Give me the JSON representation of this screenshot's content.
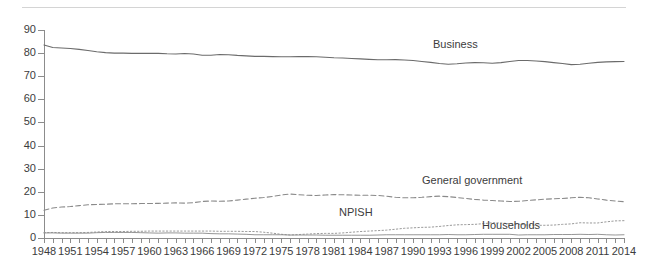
{
  "chart_data": {
    "type": "line",
    "title": "",
    "subtitle": "",
    "xlabel": "",
    "ylabel": "",
    "ylim": [
      0,
      90
    ],
    "xlim": [
      1948,
      2014
    ],
    "grid": false,
    "legend_position": "inline-labels",
    "ytick_labels": [
      "0",
      "10",
      "20",
      "30",
      "40",
      "50",
      "60",
      "70",
      "80",
      "90"
    ],
    "ytick_values": [
      0,
      10,
      20,
      30,
      40,
      50,
      60,
      70,
      80,
      90
    ],
    "xtick_labels": [
      "1948",
      "1951",
      "1954",
      "1957",
      "1960",
      "1963",
      "1966",
      "1969",
      "1972",
      "1975",
      "1978",
      "1981",
      "1984",
      "1987",
      "1990",
      "1993",
      "1996",
      "1999",
      "2002",
      "2005",
      "2008",
      "2011",
      "2014"
    ],
    "xtick_values": [
      1948,
      1951,
      1954,
      1957,
      1960,
      1963,
      1966,
      1969,
      1972,
      1975,
      1978,
      1981,
      1984,
      1987,
      1990,
      1993,
      1996,
      1999,
      2002,
      2005,
      2008,
      2011,
      2014
    ],
    "x": [
      1948,
      1949,
      1950,
      1951,
      1952,
      1953,
      1954,
      1955,
      1956,
      1957,
      1958,
      1959,
      1960,
      1961,
      1962,
      1963,
      1964,
      1965,
      1966,
      1967,
      1968,
      1969,
      1970,
      1971,
      1972,
      1973,
      1974,
      1975,
      1976,
      1977,
      1978,
      1979,
      1980,
      1981,
      1982,
      1983,
      1984,
      1985,
      1986,
      1987,
      1988,
      1989,
      1990,
      1991,
      1992,
      1993,
      1994,
      1995,
      1996,
      1997,
      1998,
      1999,
      2000,
      2001,
      2002,
      2003,
      2004,
      2005,
      2006,
      2007,
      2008,
      2009,
      2010,
      2011,
      2012,
      2013,
      2014
    ],
    "series": [
      {
        "name": "Business",
        "style": "solid",
        "color": "#6b6b6b",
        "annotation_label": "Business",
        "values": [
          83.5,
          82.4,
          82.2,
          82.0,
          81.6,
          81.1,
          80.6,
          80.2,
          80.0,
          80.0,
          79.9,
          79.9,
          79.9,
          79.9,
          79.7,
          79.6,
          79.8,
          79.6,
          79.1,
          79.1,
          79.4,
          79.3,
          79.0,
          78.8,
          78.6,
          78.6,
          78.5,
          78.4,
          78.4,
          78.5,
          78.5,
          78.4,
          78.2,
          78.0,
          77.9,
          77.7,
          77.5,
          77.3,
          77.1,
          77.1,
          77.2,
          77.0,
          76.8,
          76.4,
          76.0,
          75.5,
          75.2,
          75.4,
          75.7,
          75.9,
          75.8,
          75.6,
          75.9,
          76.4,
          76.8,
          76.8,
          76.6,
          76.3,
          75.9,
          75.5,
          75.0,
          75.2,
          75.6,
          76.0,
          76.2,
          76.3,
          76.4
        ]
      },
      {
        "name": "General government",
        "style": "dashed",
        "color": "#8a8a8a",
        "annotation_label": "General government",
        "values": [
          12.0,
          13.0,
          13.4,
          13.6,
          14.0,
          14.4,
          14.5,
          14.6,
          14.8,
          14.8,
          14.8,
          14.9,
          14.9,
          15.0,
          15.1,
          15.2,
          15.1,
          15.3,
          15.8,
          16.0,
          15.9,
          16.0,
          16.4,
          16.8,
          17.2,
          17.5,
          18.0,
          18.6,
          19.0,
          18.7,
          18.5,
          18.4,
          18.6,
          18.8,
          18.7,
          18.6,
          18.5,
          18.5,
          18.4,
          18.1,
          17.6,
          17.4,
          17.4,
          17.6,
          17.9,
          18.1,
          17.9,
          17.5,
          17.1,
          16.7,
          16.4,
          16.2,
          16.0,
          15.8,
          15.9,
          16.2,
          16.5,
          16.8,
          17.0,
          17.1,
          17.4,
          17.6,
          17.4,
          16.9,
          16.4,
          16.0,
          15.7
        ]
      },
      {
        "name": "NPISH",
        "style": "dotted",
        "color": "#9a9a9a",
        "annotation_label": "NPISH",
        "values": [
          2.3,
          2.4,
          2.3,
          2.3,
          2.3,
          2.4,
          2.6,
          2.8,
          2.8,
          2.8,
          2.9,
          2.9,
          3.0,
          3.0,
          3.0,
          3.0,
          3.0,
          3.0,
          3.0,
          3.0,
          2.9,
          2.9,
          2.9,
          2.8,
          2.8,
          2.5,
          2.1,
          1.6,
          1.3,
          1.5,
          1.7,
          1.9,
          2.0,
          2.0,
          2.2,
          2.5,
          2.8,
          3.0,
          3.2,
          3.4,
          3.8,
          4.2,
          4.4,
          4.6,
          4.7,
          5.0,
          5.4,
          5.7,
          5.8,
          5.9,
          6.2,
          6.6,
          6.5,
          6.2,
          6.0,
          5.6,
          5.5,
          5.5,
          5.6,
          5.9,
          6.1,
          6.6,
          6.5,
          6.5,
          7.0,
          7.4,
          7.5
        ]
      },
      {
        "name": "Households",
        "style": "solid-thin",
        "color": "#8a8a8a",
        "annotation_label": "Households",
        "values": [
          2.2,
          2.2,
          2.1,
          2.1,
          2.1,
          2.1,
          2.3,
          2.4,
          2.4,
          2.4,
          2.4,
          2.3,
          2.2,
          2.1,
          2.2,
          2.2,
          2.1,
          2.1,
          2.1,
          1.9,
          1.8,
          1.8,
          1.7,
          1.6,
          1.4,
          1.4,
          1.4,
          1.4,
          1.3,
          1.3,
          1.3,
          1.3,
          1.2,
          1.2,
          1.2,
          1.2,
          1.2,
          1.2,
          1.3,
          1.4,
          1.4,
          1.4,
          1.4,
          1.4,
          1.4,
          1.4,
          1.5,
          1.4,
          1.4,
          1.5,
          1.6,
          1.6,
          1.6,
          1.6,
          1.3,
          1.4,
          1.4,
          1.4,
          1.5,
          1.5,
          1.5,
          1.6,
          1.5,
          1.6,
          1.4,
          1.3,
          1.4
        ]
      }
    ]
  },
  "accent_colors": {
    "axis": "#8c8c8c",
    "text": "#3c3c3c",
    "rule": "#d4d4d4"
  }
}
